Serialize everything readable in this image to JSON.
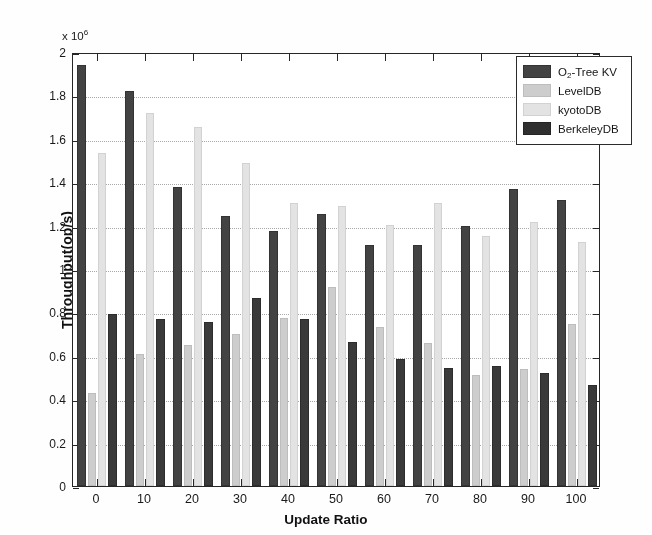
{
  "chart_data": {
    "type": "bar",
    "title": "",
    "subtitle": "",
    "xlabel": "Update Ratio",
    "ylabel": "Throughput(op/s)",
    "y_exponent_label": "x 10",
    "y_exponent_value": "6",
    "xlim": [
      -0.5,
      10.5
    ],
    "ylim": [
      0,
      2
    ],
    "ytick_values": [
      0,
      0.2,
      0.4,
      0.6,
      0.8,
      1,
      1.2,
      1.4,
      1.6,
      1.8,
      2
    ],
    "ytick_labels": [
      "0",
      "0.2",
      "0.4",
      "0.6",
      "0.8",
      "1",
      "1.2",
      "1.4",
      "1.6",
      "1.8",
      "2"
    ],
    "grid": true,
    "grid_axis": "y",
    "grid_style": "dotted",
    "legend_position": "top-right",
    "categories": [
      "0",
      "10",
      "20",
      "30",
      "40",
      "50",
      "60",
      "70",
      "80",
      "90",
      "100"
    ],
    "series": [
      {
        "name": "O_2-Tree KV",
        "display_name": "O",
        "subscript": "2",
        "suffix": "-Tree KV",
        "color": "#434343",
        "values": [
          1.94,
          1.82,
          1.38,
          1.245,
          1.175,
          1.255,
          1.11,
          1.11,
          1.2,
          1.37,
          1.32
        ]
      },
      {
        "name": "LevelDB",
        "display_name": "LevelDB",
        "color": "#cdcdcd",
        "values": [
          0.43,
          0.61,
          0.65,
          0.7,
          0.775,
          0.915,
          0.735,
          0.66,
          0.51,
          0.54,
          0.745
        ]
      },
      {
        "name": "kyotoDB",
        "display_name": "kyotoDB",
        "color": "#e3e3e3",
        "values": [
          1.535,
          1.72,
          1.655,
          1.49,
          1.305,
          1.29,
          1.205,
          1.305,
          1.15,
          1.215,
          1.125
        ]
      },
      {
        "name": "BerkeleyDB",
        "display_name": "BerkeleyDB",
        "color": "#2f2f2f",
        "values": [
          0.795,
          0.77,
          0.755,
          0.865,
          0.77,
          0.665,
          0.585,
          0.545,
          0.555,
          0.52,
          0.465
        ]
      }
    ]
  },
  "legend": {
    "entries": [
      {
        "label_main": "O",
        "label_sub": "2",
        "label_rest": "-Tree KV",
        "swatch": "s0"
      },
      {
        "label_main": "LevelDB",
        "label_sub": "",
        "label_rest": "",
        "swatch": "s1"
      },
      {
        "label_main": "kyotoDB",
        "label_sub": "",
        "label_rest": "",
        "swatch": "s2"
      },
      {
        "label_main": "BerkeleyDB",
        "label_sub": "",
        "label_rest": "",
        "swatch": "s3"
      }
    ]
  }
}
